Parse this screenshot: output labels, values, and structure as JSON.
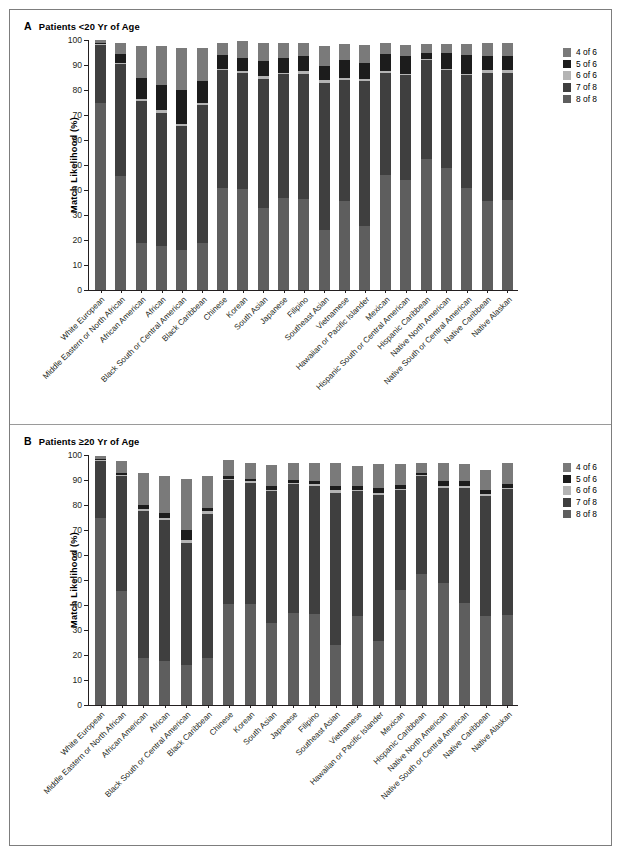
{
  "figure": {
    "panels": [
      {
        "letter": "A",
        "title": "Patients <20 Yr of Age"
      },
      {
        "letter": "B",
        "title": "Patients ≥20 Yr of Age"
      }
    ]
  },
  "axis": {
    "y_title": "Match Likelihood (%)",
    "y_ticks": [
      "0",
      "10",
      "20",
      "30",
      "40",
      "50",
      "60",
      "70",
      "80",
      "90",
      "100"
    ],
    "y_min": 0,
    "y_max": 100
  },
  "legend": {
    "items": [
      {
        "label": "4 of 6",
        "color": "#7a7a7a"
      },
      {
        "label": "5 of 6",
        "color": "#1c1c1c"
      },
      {
        "label": "6 of 6",
        "color": "#b4b4b4"
      },
      {
        "label": "7 of 8",
        "color": "#3f3f3f"
      },
      {
        "label": "8 of 8",
        "color": "#5e5e5e"
      }
    ]
  },
  "chart_data": [
    {
      "type": "bar",
      "title": "Patients <20 Yr of Age",
      "stacked": true,
      "xlabel": "",
      "ylabel": "Match Likelihood (%)",
      "ylim": [
        0,
        100
      ],
      "grid": false,
      "legend_position": "right",
      "categories": [
        "White European",
        "Middle Eastern or North African",
        "African American",
        "African",
        "Black South or Central American",
        "Black Caribbean",
        "Chinese",
        "Korean",
        "South Asian",
        "Japanese",
        "Filipino",
        "Southeast Asian",
        "Vietnamese",
        "Hawaiian or Pacific Islander",
        "Mexican",
        "Hispanic South or Central American",
        "Hispanic Caribbean",
        "Native North American",
        "Native South or Central American",
        "Native Caribbean",
        "Native Alaskan"
      ],
      "series": [
        {
          "name": "8 of 8",
          "color": "#5e5e5e",
          "values": [
            75,
            45.5,
            19,
            17.5,
            16,
            19,
            41,
            40.5,
            33,
            37,
            36.5,
            24,
            35.5,
            25.5,
            46,
            44,
            52.5,
            49,
            41,
            35.5,
            36
          ]
        },
        {
          "name": "7 of 8",
          "color": "#3f3f3f",
          "values": [
            23,
            45,
            56.5,
            53.5,
            49.5,
            55,
            47,
            46.5,
            51.5,
            49.5,
            50,
            59,
            48.5,
            58,
            41,
            42,
            39.5,
            39,
            45,
            51.5,
            51
          ]
        },
        {
          "name": "6 of 6",
          "color": "#b4b4b4",
          "values": [
            0.5,
            0.5,
            1,
            1,
            1,
            1,
            0.5,
            0.5,
            1,
            0.5,
            1,
            1,
            1,
            1,
            0.5,
            0.5,
            0.5,
            0.5,
            0.5,
            1,
            1
          ]
        },
        {
          "name": "5 of 6",
          "color": "#1c1c1c",
          "values": [
            0.5,
            3.5,
            8.5,
            10,
            13.5,
            8.5,
            5.5,
            5.5,
            6,
            6,
            6,
            5.5,
            7,
            6.5,
            7,
            7,
            2.5,
            6.5,
            7.5,
            5.5,
            5.5
          ]
        },
        {
          "name": "4 of 6",
          "color": "#7a7a7a",
          "values": [
            1,
            4.5,
            12.5,
            15.5,
            17,
            13.5,
            5,
            6.5,
            7.5,
            6,
            5.5,
            8,
            6.5,
            7,
            4.5,
            4.5,
            3.5,
            3.5,
            4.5,
            5.5,
            5.5
          ]
        }
      ]
    },
    {
      "type": "bar",
      "title": "Patients ≥20 Yr of Age",
      "stacked": true,
      "xlabel": "",
      "ylabel": "Match Likelihood (%)",
      "ylim": [
        0,
        100
      ],
      "grid": false,
      "legend_position": "right",
      "categories": [
        "White European",
        "Middle Eastern or North African",
        "African American",
        "African",
        "Black South or Central American",
        "Black Caribbean",
        "Chinese",
        "Korean",
        "South Asian",
        "Japanese",
        "Filipino",
        "Southeast Asian",
        "Vietnamese",
        "Hawaiian or Pacific Islander",
        "Mexican",
        "Hispanic Caribbean",
        "Native North American",
        "Native South or Central American",
        "Native Caribbean",
        "Native Alaskan"
      ],
      "series": [
        {
          "name": "8 of 8",
          "color": "#5e5e5e",
          "values": [
            75,
            45.5,
            19,
            17.5,
            16,
            19,
            40.5,
            40.5,
            33,
            37,
            36.5,
            24,
            35.5,
            25.5,
            46,
            52.5,
            49,
            41,
            35.5,
            36
          ]
        },
        {
          "name": "7 of 8",
          "color": "#3f3f3f",
          "values": [
            22.5,
            46,
            58.5,
            56.5,
            49,
            57.5,
            49.5,
            48.5,
            52.5,
            51.5,
            51,
            61,
            50,
            58.5,
            40,
            39,
            38,
            46,
            48,
            50.5
          ]
        },
        {
          "name": "6 of 6",
          "color": "#b4b4b4",
          "values": [
            0.5,
            0.5,
            1,
            1,
            1,
            1,
            0.5,
            0.5,
            0.5,
            0.5,
            1,
            1,
            0.5,
            1,
            0.5,
            0.5,
            0.5,
            0.5,
            1,
            0.5
          ]
        },
        {
          "name": "5 of 6",
          "color": "#1c1c1c",
          "values": [
            0.5,
            1,
            1.5,
            2,
            4,
            1.5,
            1,
            1,
            1.5,
            1,
            1,
            1.5,
            1.5,
            2,
            1.5,
            1,
            2,
            2,
            1.5,
            1.5
          ]
        },
        {
          "name": "4 of 6",
          "color": "#7a7a7a",
          "values": [
            1,
            4.5,
            13,
            14.5,
            20.5,
            12.5,
            6.5,
            6.5,
            8.5,
            7,
            7.5,
            9.5,
            8,
            9.5,
            8.5,
            4,
            7.5,
            7,
            8,
            8.5
          ]
        }
      ]
    }
  ]
}
